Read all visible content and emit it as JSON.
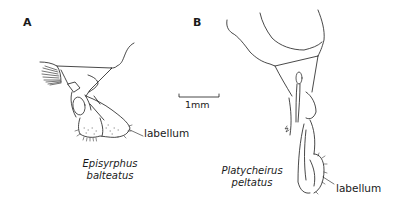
{
  "figure": {
    "panels": [
      {
        "label": "A",
        "species": "Episyrphus balteatus",
        "annotation": "labellum"
      },
      {
        "label": "B",
        "species_line1": "Platycheirus",
        "species_line2": "peltatus",
        "annotation": "labellum"
      }
    ],
    "scale_bar": {
      "label": "1mm"
    }
  }
}
